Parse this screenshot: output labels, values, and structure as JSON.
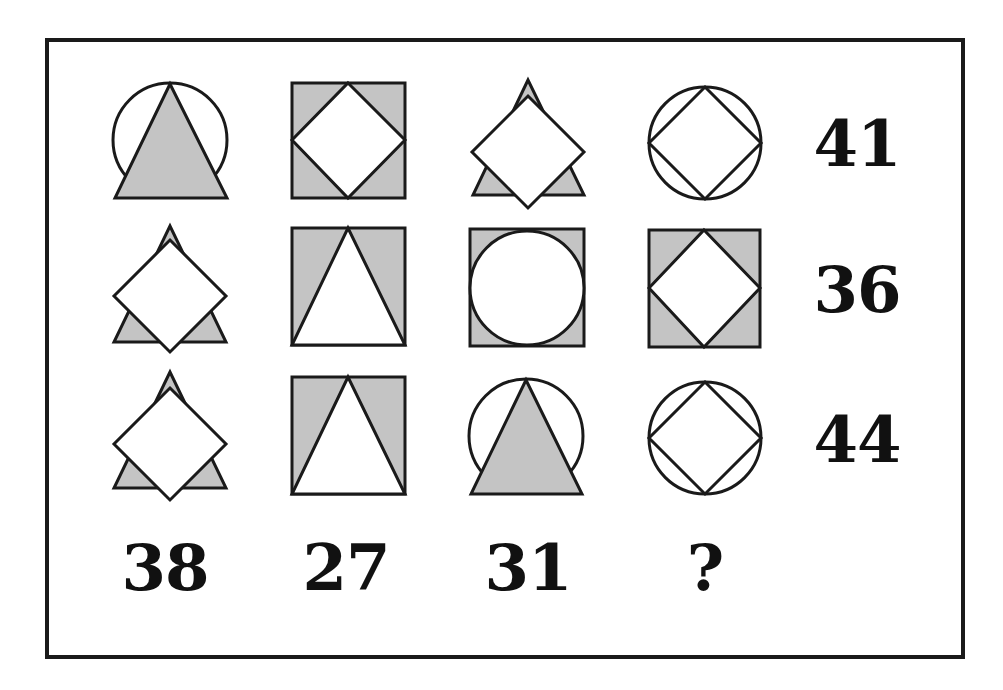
{
  "puzzle": {
    "grid": [
      [
        "circle-with-triangle",
        "square-with-diamond",
        "triangle-with-diamond",
        "circle-with-diamond"
      ],
      [
        "triangle-with-diamond",
        "square-with-triangle",
        "square-with-circle",
        "square-with-diamond"
      ],
      [
        "triangle-with-diamond",
        "square-with-triangle",
        "circle-with-triangle",
        "circle-with-diamond"
      ]
    ],
    "row_sums": [
      "41",
      "36",
      "44"
    ],
    "column_sums": [
      "38",
      "27",
      "31",
      "?"
    ]
  },
  "colors": {
    "fill_shaded": "#c4c4c4",
    "stroke": "#1a1a1a",
    "background": "#ffffff"
  }
}
